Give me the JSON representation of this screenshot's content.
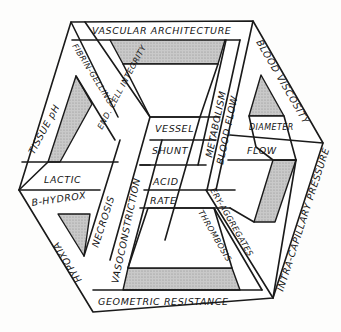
{
  "diagram": {
    "type": "labeled impossible-cube frame",
    "colors": {
      "line": "#1a1a1a",
      "fill": "#ffffff",
      "shading": "#bdbdbd"
    },
    "labels": {
      "top_front": "VASCULAR ARCHITECTURE",
      "top_left_outer": "FIBRIN-GELLING",
      "top_left_inner": "END. CELL INTEGRITY",
      "top_right": "BLOOD VISCOSITY",
      "left_outer": "TISSUE pH",
      "left_lactic": "LACTIC",
      "left_hydrox": "B-HYDROX",
      "left_lower": "HYPOXIA",
      "center_necrosis": "NECROSIS",
      "center_vasoconstriction": "VASOCONSTRICTION",
      "center_vessel": "VESSEL",
      "center_shunt": "SHUNT",
      "center_acid": "ACID",
      "center_rate": "RATE",
      "center_metabolism": "METABOLISM",
      "center_blood_flow": "BLOOD FLOW",
      "right_diameter": "DIAMETER",
      "right_flow": "FLOW",
      "right_lower": "INTRA-CAPILLARY PRESSURE",
      "lower_ery": "ERY-AGGREGATES",
      "lower_thrombosis": "THROMBOSIS",
      "bottom": "GEOMETRIC RESISTANCE"
    }
  }
}
